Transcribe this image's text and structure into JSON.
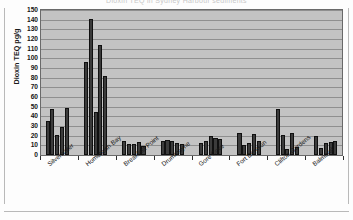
{
  "figure": {
    "cropped_title_remnant": "Dioxin TEQ in Sydney Harbour sediments"
  },
  "chart_data": {
    "type": "bar",
    "title": "",
    "xlabel": "",
    "ylabel": "Dioxin TEQ pg/g",
    "ylim": [
      0,
      150
    ],
    "ytick_step": 10,
    "yticks": [
      "150",
      "140",
      "130",
      "120",
      "110",
      "100",
      "90",
      "80",
      "70",
      "60",
      "50",
      "40",
      "30",
      "20",
      "10",
      "0"
    ],
    "grid": true,
    "legend": "none",
    "plot_background": "#c3c3c3",
    "bar_color": "#3b3b3b",
    "categories": [
      "Silverwater",
      "Homebush Bay",
      "Breakfast Point",
      "Drummoyne",
      "Gore Cove",
      "Fort Denison",
      "Clifton Gardens",
      "Balmoral"
    ],
    "groups": [
      {
        "category": "Silverwater",
        "values": [
          35,
          48,
          21,
          29,
          49
        ]
      },
      {
        "category": "Homebush Bay",
        "values": [
          96,
          141,
          45,
          114,
          82
        ]
      },
      {
        "category": "Breakfast Point",
        "values": [
          15,
          11,
          11,
          13,
          9
        ]
      },
      {
        "category": "Drummoyne",
        "values": [
          14,
          16,
          15,
          12,
          11
        ]
      },
      {
        "category": "Gore Cove",
        "values": [
          12,
          14,
          20,
          18,
          17
        ]
      },
      {
        "category": "Fort Denison",
        "values": [
          23,
          10,
          12,
          22,
          14
        ]
      },
      {
        "category": "Clifton Gardens",
        "values": [
          48,
          21,
          6,
          23,
          8
        ]
      },
      {
        "category": "Balmoral",
        "values": [
          20,
          7,
          12,
          13,
          15
        ]
      }
    ]
  }
}
